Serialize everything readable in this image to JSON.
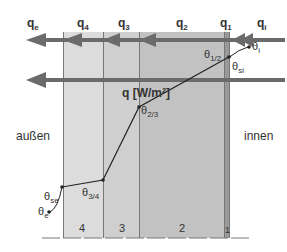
{
  "flux_labels": {
    "qe": {
      "main": "q",
      "sub": "e"
    },
    "q4": {
      "main": "q",
      "sub": "4"
    },
    "q3": {
      "main": "q",
      "sub": "3"
    },
    "q2": {
      "main": "q",
      "sub": "2"
    },
    "q1": {
      "main": "q",
      "sub": "1"
    },
    "qi": {
      "main": "q",
      "sub": "i"
    }
  },
  "heat_flux_label": "q [W/m²]",
  "temperature_labels": {
    "theta_e": {
      "main": "θ",
      "sub": "e"
    },
    "theta_se": {
      "main": "θ",
      "sub": "se"
    },
    "theta_34": {
      "main": "θ",
      "sub": "3/4"
    },
    "theta_23": {
      "main": "θ",
      "sub": "2/3"
    },
    "theta_12": {
      "main": "θ",
      "sub": "1/2"
    },
    "theta_si": {
      "main": "θ",
      "sub": "si"
    },
    "theta_i": {
      "main": "θ",
      "sub": "i"
    }
  },
  "sides": {
    "outside": "außen",
    "inside": "innen"
  },
  "layers": [
    {
      "number": "4",
      "color": "#dcdcdc"
    },
    {
      "number": "3",
      "color": "#cfcfcf"
    },
    {
      "number": "2",
      "color": "#c2c2c2"
    },
    {
      "number": "1",
      "color": "#9a9a9a"
    }
  ],
  "colors": {
    "arrow": "#6b6b6b",
    "line": "#222222"
  }
}
